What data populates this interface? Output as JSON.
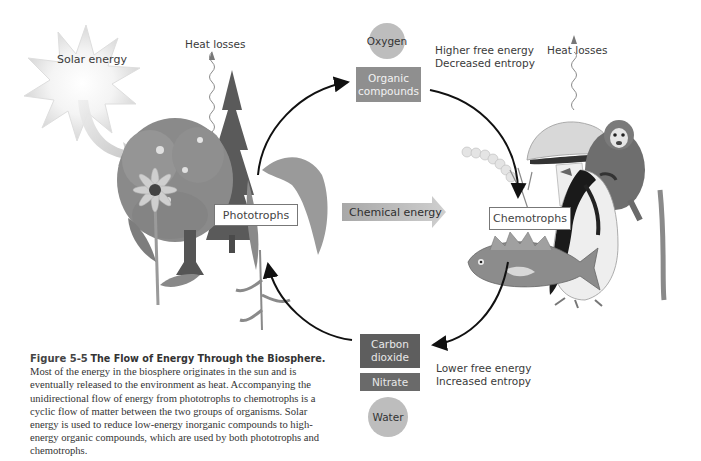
{
  "diagram": {
    "title": "The Flow of Energy Through the Biosphere",
    "sun": {
      "label": "Solar energy"
    },
    "heat_left": {
      "label": "Heat losses"
    },
    "heat_right": {
      "label": "Heat losses"
    },
    "oxygen": {
      "label": "Oxygen"
    },
    "organic_compounds": {
      "line1": "Organic",
      "line2": "compounds"
    },
    "higher_energy": {
      "line1": "Higher free energy",
      "line2": "Decreased entropy"
    },
    "phototrophs": {
      "label": "Phototrophs"
    },
    "chemical_energy": {
      "label": "Chemical energy"
    },
    "chemotrophs": {
      "label": "Chemotrophs"
    },
    "carbon_dioxide": {
      "line1": "Carbon",
      "line2": "dioxide"
    },
    "nitrate": {
      "label": "Nitrate"
    },
    "water": {
      "label": "Water"
    },
    "lower_energy": {
      "line1": "Lower free energy",
      "line2": "Increased entropy"
    },
    "organisms": {
      "phototrophs": [
        "tree",
        "conifer",
        "coneflower",
        "fern"
      ],
      "chemotrophs": [
        "bacteria chain",
        "fungus/mushroom",
        "fish",
        "penguin",
        "monkey"
      ]
    },
    "colors": {
      "organic_box": "#8f8f8f",
      "co2_box": "#5e5e5e",
      "nitrate_box": "#6a6a6a",
      "circle": "#bdbdbd",
      "chemical_arrow": "#b0b0b0"
    }
  },
  "caption": {
    "figure_number": "Figure 5-5",
    "title": "The Flow of Energy Through the Biosphere.",
    "body": "Most of the energy in the biosphere originates in the sun and is eventually released to the environment as heat. Accompanying the unidirectional flow of energy from phototrophs to chemotrophs is a cyclic flow of matter between the two groups of organisms. Solar energy is used to reduce low-energy inorganic compounds to high-energy organic compounds, which are used by both phototrophs and chemotrophs."
  }
}
